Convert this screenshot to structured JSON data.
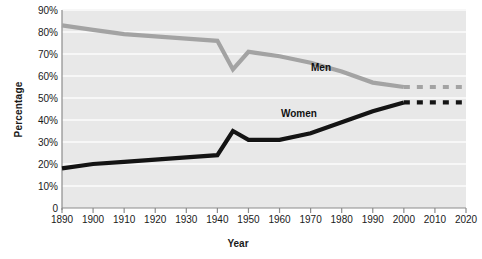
{
  "chart_data": {
    "type": "line",
    "title": "",
    "xlabel": "Year",
    "ylabel": "Percentage",
    "xlim": [
      1890,
      2020
    ],
    "ylim": [
      0,
      90
    ],
    "grid": true,
    "legend_position": "inline-annotation",
    "x_ticks": [
      "1890",
      "1900",
      "1910",
      "1920",
      "1930",
      "1940",
      "1950",
      "1960",
      "1970",
      "1980",
      "1990",
      "2000",
      "2010",
      "2020"
    ],
    "x_tick_values": [
      1890,
      1900,
      1910,
      1920,
      1930,
      1940,
      1950,
      1960,
      1970,
      1980,
      1990,
      2000,
      2010,
      2020
    ],
    "y_ticks": [
      "0",
      "10%",
      "20%",
      "30%",
      "40%",
      "50%",
      "60%",
      "70%",
      "80%",
      "90%"
    ],
    "y_tick_values": [
      0,
      10,
      20,
      30,
      40,
      50,
      60,
      70,
      80,
      90
    ],
    "series": [
      {
        "name": "Men",
        "color": "#a3a3a3",
        "label_text": "Men",
        "x": [
          1890,
          1900,
          1910,
          1920,
          1930,
          1940,
          1945,
          1950,
          1960,
          1970,
          1980,
          1990,
          2000
        ],
        "values": [
          83,
          81,
          79,
          78,
          77,
          76,
          63,
          71,
          69,
          66,
          62,
          57,
          55
        ],
        "projection_x": [
          2000,
          2020
        ],
        "projection_values": [
          55,
          55
        ],
        "projection_style": "dashed"
      },
      {
        "name": "Women",
        "color": "#141414",
        "label_text": "Women",
        "x": [
          1890,
          1900,
          1910,
          1920,
          1930,
          1940,
          1945,
          1950,
          1960,
          1970,
          1980,
          1990,
          2000
        ],
        "values": [
          18,
          20,
          21,
          22,
          23,
          24,
          35,
          31,
          31,
          34,
          39,
          44,
          48
        ],
        "projection_x": [
          2000,
          2020
        ],
        "projection_values": [
          48,
          48
        ],
        "projection_style": "dashed"
      }
    ]
  },
  "style": {
    "plot_background": "#e8e8e8",
    "gridline_color": "#f7f7f7",
    "axis_color": "#8c8c8c",
    "text_color": "#1a1a1a"
  }
}
